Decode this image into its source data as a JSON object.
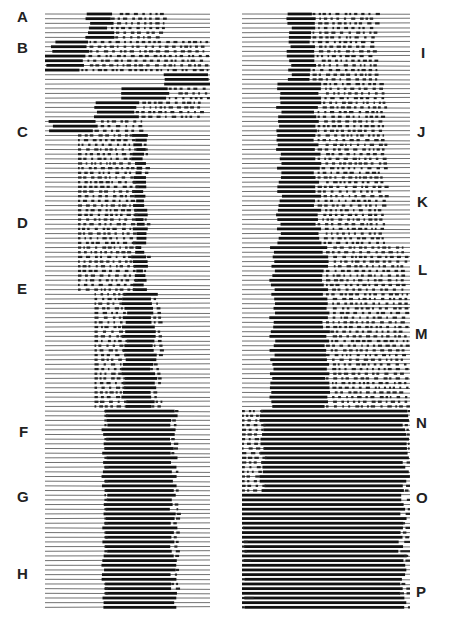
{
  "figure": {
    "left_panel": {
      "x": 45,
      "width": 165,
      "top": 14,
      "bottom": 612,
      "rows": 128,
      "labels": [
        {
          "text": "A",
          "x": 17,
          "y": 9
        },
        {
          "text": "B",
          "x": 17,
          "y": 40
        },
        {
          "text": "C",
          "x": 17,
          "y": 124
        },
        {
          "text": "D",
          "x": 17,
          "y": 215
        },
        {
          "text": "E",
          "x": 17,
          "y": 281
        },
        {
          "text": "F",
          "x": 19,
          "y": 424
        },
        {
          "text": "G",
          "x": 17,
          "y": 489
        },
        {
          "text": "H",
          "x": 17,
          "y": 566
        }
      ],
      "bands": [
        {
          "from": 0,
          "to": 6,
          "start": 0.26,
          "end": 0.4,
          "dotsTo": 0.72
        },
        {
          "from": 6,
          "to": 9,
          "start": 0.05,
          "end": 0.27,
          "dotsTo": 0.98
        },
        {
          "from": 9,
          "to": 13,
          "start": 0.0,
          "end": 0.22,
          "dotsTo": 0.98
        },
        {
          "from": 13,
          "to": 16,
          "start": 0.72,
          "end": 0.99,
          "dotsTo": 0.99
        },
        {
          "from": 16,
          "to": 19,
          "start": 0.45,
          "end": 0.75,
          "dotsTo": 0.99
        },
        {
          "from": 19,
          "to": 23,
          "start": 0.3,
          "end": 0.55,
          "dotsTo": 0.95
        },
        {
          "from": 23,
          "to": 26,
          "start": 0.03,
          "end": 0.3,
          "dotsTo": 0.6
        },
        {
          "from": 26,
          "to": 60,
          "start": 0.54,
          "end": 0.6,
          "dotsFrom": 0.2,
          "dotsTo": 0.62
        },
        {
          "from": 60,
          "to": 85,
          "start": 0.48,
          "end": 0.66,
          "dotsFrom": 0.3,
          "dotsTo": 0.7
        },
        {
          "from": 85,
          "to": 128,
          "start": 0.36,
          "end": 0.78,
          "dotsFrom": 0.36,
          "dotsTo": 0.8
        }
      ]
    },
    "right_panel": {
      "x": 242,
      "width": 168,
      "top": 14,
      "bottom": 612,
      "rows": 128,
      "labels": [
        {
          "text": "I",
          "x": 421,
          "y": 45
        },
        {
          "text": "J",
          "x": 417,
          "y": 124
        },
        {
          "text": "K",
          "x": 417,
          "y": 194
        },
        {
          "text": "L",
          "x": 418,
          "y": 262
        },
        {
          "text": "M",
          "x": 415,
          "y": 326
        },
        {
          "text": "N",
          "x": 416,
          "y": 415
        },
        {
          "text": "O",
          "x": 416,
          "y": 490
        },
        {
          "text": "P",
          "x": 416,
          "y": 584
        }
      ],
      "bands": [
        {
          "from": 0,
          "to": 15,
          "start": 0.28,
          "end": 0.42,
          "dotsTo": 0.8
        },
        {
          "from": 15,
          "to": 50,
          "start": 0.22,
          "end": 0.45,
          "dotsTo": 0.85
        },
        {
          "from": 50,
          "to": 85,
          "start": 0.18,
          "end": 0.5,
          "dotsTo": 0.98
        },
        {
          "from": 85,
          "to": 103,
          "start": 0.12,
          "end": 0.98,
          "dotsFrom": 0.0,
          "dotsTo": 0.99
        },
        {
          "from": 103,
          "to": 128,
          "start": 0.0,
          "end": 0.95,
          "dotsFrom": 0.0,
          "dotsTo": 0.99,
          "scatter": true
        }
      ]
    }
  }
}
